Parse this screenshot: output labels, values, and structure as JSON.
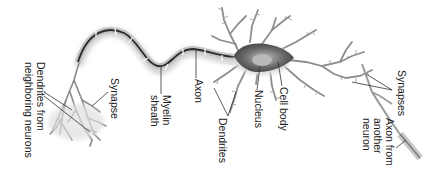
{
  "diagram": {
    "labels": {
      "dendrites_from_neighboring": "Dendrites from\nneighboring neurons",
      "synapse": "Synapse",
      "myelin_sheath": "Myelin\nsheath",
      "axon": "Axon",
      "dendrites": "Dendrites",
      "nucleus": "Nucleus",
      "cell_body": "Cell body",
      "synapses": "Synapses",
      "axon_from_another": "Axon from\nanother\nneuron"
    },
    "colors": {
      "axon_dark": "#2a2a2a",
      "myelin": "#bdbdbd",
      "shadow": "#d4d4d4",
      "cell_body": "#5a5a5a",
      "dendrite": "#8a8a8a",
      "leader_line": "#333333"
    }
  }
}
